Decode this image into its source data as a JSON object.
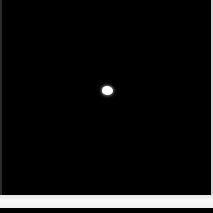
{
  "image": {
    "background_color": "#000000",
    "subject": {
      "shape": "white-blob",
      "color": "#ffffff",
      "center": [
        105,
        90
      ]
    },
    "lower_strip_color": "#f2f2f2",
    "bottom_bar_color": "#000000"
  }
}
